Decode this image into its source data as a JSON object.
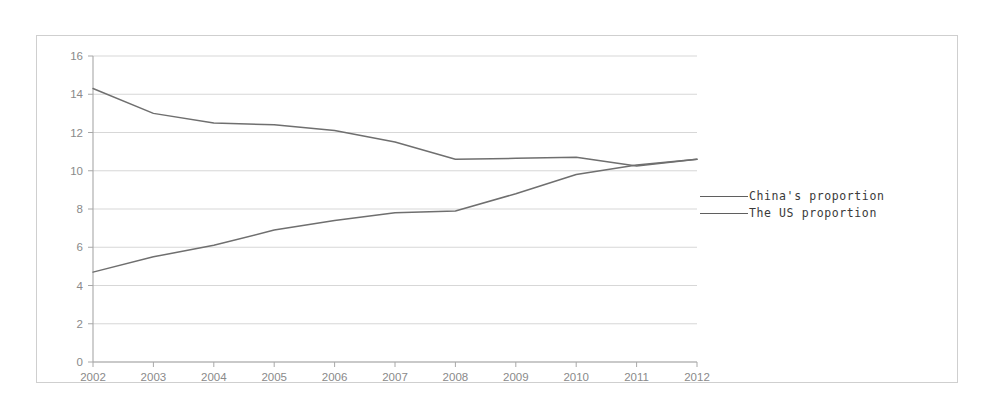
{
  "chart_data": {
    "type": "line",
    "title": "",
    "subtitle": "",
    "xlabel": "",
    "ylabel": "",
    "x": [
      2002,
      2003,
      2004,
      2005,
      2006,
      2007,
      2008,
      2009,
      2010,
      2011,
      2012
    ],
    "categories": [
      "2002",
      "2003",
      "2004",
      "2005",
      "2006",
      "2007",
      "2008",
      "2009",
      "2010",
      "2011",
      "2012"
    ],
    "series": [
      {
        "name": "China's proportion",
        "values": [
          4.7,
          5.5,
          6.1,
          6.9,
          7.4,
          7.8,
          7.9,
          8.8,
          9.8,
          10.3,
          10.6
        ]
      },
      {
        "name": "The US proportion",
        "values": [
          14.3,
          13.0,
          12.5,
          12.4,
          12.1,
          11.5,
          10.6,
          10.65,
          10.7,
          10.25,
          10.6
        ]
      }
    ],
    "xlim": [
      2002,
      2012
    ],
    "ylim": [
      0,
      16
    ],
    "ytick_step": 2,
    "yticks": [
      "0",
      "2",
      "4",
      "6",
      "8",
      "10",
      "12",
      "14",
      "16"
    ],
    "grid": true,
    "grid_axis": "y",
    "legend_position": "right",
    "line_color": "#6f6f6f",
    "grid_color": "#d3d3d3",
    "axis_color": "#a8a8a8",
    "tick_label_color": "#8a8a8a",
    "background_color": "#ffffff",
    "frame_color": "#cfcfcf"
  },
  "legend": {
    "items": [
      {
        "label": "China's proportion",
        "marker": "line-swatch"
      },
      {
        "label": "The US proportion",
        "marker": "line-swatch"
      }
    ]
  }
}
